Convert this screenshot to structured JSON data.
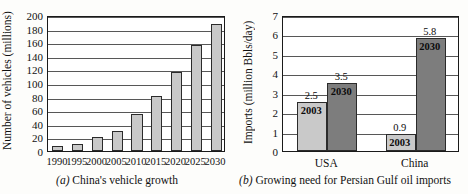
{
  "figure": {
    "panel_a": {
      "caption_marker": "(a)",
      "caption_text": " China's vehicle growth",
      "ylabel": "Number of vehicles (millions)"
    },
    "panel_b": {
      "caption_marker": "(b)",
      "caption_text": " Growing need for Persian Gulf oil imports",
      "ylabel": "Imports (million Bbls/day)"
    }
  },
  "chart_data": [
    {
      "type": "bar",
      "title": "(a) China's vehicle growth",
      "xlabel": "",
      "ylabel": "Number of vehicles (millions)",
      "categories": [
        "1990",
        "1995",
        "2000",
        "2005",
        "2010",
        "2015",
        "2020",
        "2025",
        "2030"
      ],
      "values": [
        7,
        10,
        20,
        30,
        55,
        81,
        116,
        156,
        187
      ],
      "ylim": [
        0,
        200
      ],
      "yticks": [
        0,
        20,
        40,
        60,
        80,
        100,
        120,
        140,
        160,
        180,
        200
      ],
      "ytick_labels": [
        "0",
        "20",
        "40",
        "60",
        "80",
        "100",
        "120",
        "140",
        "160",
        "180",
        "200"
      ],
      "grid": true,
      "legend": "none",
      "bar_color": "#c9c9c9",
      "bar_edge_color": "#2b2b2b"
    },
    {
      "type": "bar",
      "title": "(b) Growing need for Persian Gulf oil imports",
      "xlabel": "",
      "ylabel": "Imports (million Bbls/day)",
      "categories": [
        "USA",
        "China"
      ],
      "series": [
        {
          "name": "2003",
          "values": [
            2.5,
            0.9
          ],
          "color": "#c9c9c9"
        },
        {
          "name": "2030",
          "values": [
            3.5,
            5.8
          ],
          "color": "#7d7d7d"
        }
      ],
      "data_labels": [
        "2.5",
        "3.5",
        "0.9",
        "5.8"
      ],
      "inside_labels": [
        "2003",
        "2030",
        "2003",
        "2030"
      ],
      "ylim": [
        0,
        7
      ],
      "yticks": [
        0,
        1,
        2,
        3,
        4,
        5,
        6,
        7
      ],
      "ytick_labels": [
        "0",
        "1",
        "2",
        "3",
        "4",
        "5",
        "6",
        "7"
      ],
      "grid": true,
      "legend": "none",
      "bar_edge_color": "#2b2b2b"
    }
  ]
}
